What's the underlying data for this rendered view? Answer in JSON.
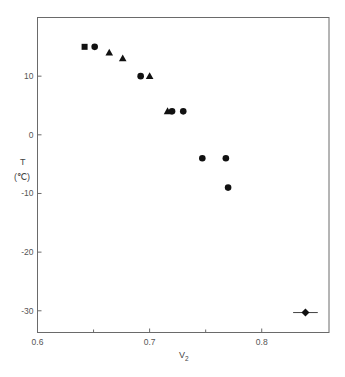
{
  "chart_data": {
    "type": "scatter",
    "title": "",
    "xlabel": "V₂",
    "ylabel": "T",
    "ylabel_unit": "(℃)",
    "xlim": [
      0.6,
      0.86
    ],
    "ylim": [
      -33.7,
      20
    ],
    "xticks": [
      0.6,
      0.7,
      0.8
    ],
    "xtick_labels": [
      "0.6",
      "0.7",
      "0.8"
    ],
    "x_minor_ticks": [
      0.65,
      0.75
    ],
    "yticks": [
      10,
      0,
      -10,
      -20,
      -30
    ],
    "ytick_labels": [
      "10",
      "0",
      "-10",
      "-20",
      "-30"
    ],
    "grid": false,
    "legend": null,
    "series": [
      {
        "name": "square",
        "marker": "square",
        "points": [
          {
            "x": 0.642,
            "y": 15
          }
        ]
      },
      {
        "name": "circle",
        "marker": "circle",
        "points": [
          {
            "x": 0.651,
            "y": 15
          },
          {
            "x": 0.692,
            "y": 10
          },
          {
            "x": 0.72,
            "y": 4
          },
          {
            "x": 0.73,
            "y": 4
          },
          {
            "x": 0.747,
            "y": -4
          },
          {
            "x": 0.768,
            "y": -4
          },
          {
            "x": 0.77,
            "y": -9
          }
        ]
      },
      {
        "name": "triangle",
        "marker": "triangle",
        "points": [
          {
            "x": 0.664,
            "y": 14
          },
          {
            "x": 0.676,
            "y": 13
          },
          {
            "x": 0.7,
            "y": 10
          },
          {
            "x": 0.716,
            "y": 4
          }
        ]
      },
      {
        "name": "diamond",
        "marker": "diamond",
        "points": [
          {
            "x": 0.839,
            "y": -30.3,
            "xerr": 0.011
          }
        ]
      }
    ]
  },
  "axes": {
    "x_label_main": "V",
    "x_label_sub": "2",
    "y_label": "T",
    "y_unit": "(℃)"
  },
  "colors": {
    "frame": "#6a6a6a",
    "marker": "#111111"
  }
}
